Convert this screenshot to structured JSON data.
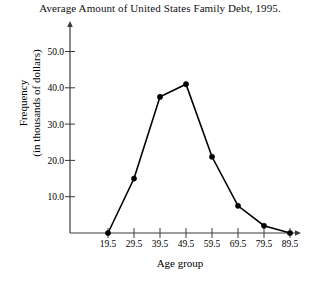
{
  "chart_data": {
    "type": "line",
    "title": "Average Amount of United States Family Debt, 1995.",
    "subtitle": "",
    "xlabel": "Age group",
    "ylabel_line1": "Frequency",
    "ylabel_line2": "(in thousands of dollars)",
    "categories": [
      "19.5",
      "29.5",
      "39.5",
      "49.5",
      "59.5",
      "69.5",
      "79.5",
      "89.5"
    ],
    "x": [
      19.5,
      29.5,
      39.5,
      49.5,
      59.5,
      69.5,
      79.5,
      89.5
    ],
    "values": [
      0,
      15,
      37.5,
      41,
      21,
      7.5,
      2,
      0
    ],
    "xtick_labels": [
      "19.5",
      "29.5",
      "39.5",
      "49.5",
      "59.5",
      "69.5",
      "79.5",
      "89.5"
    ],
    "ytick_labels": [
      "10.0",
      "20.0",
      "30.0",
      "40.0",
      "50.0"
    ],
    "ytick_values": [
      10,
      20,
      30,
      40,
      50
    ],
    "ylim": [
      0,
      56
    ],
    "xlim": [
      14.5,
      96
    ],
    "grid": false,
    "legend": false,
    "marker": "filled-circle",
    "line_color": "#000000",
    "axis_color": "#3a3a3a",
    "background_color": "#ffffff",
    "axis_arrows": true
  }
}
